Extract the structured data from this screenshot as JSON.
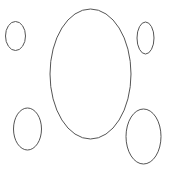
{
  "diagram": {
    "stroke_color": "#555555",
    "background_color": "#ffffff",
    "shapes": [
      {
        "name": "central-ellipse",
        "kind": "ellipse"
      },
      {
        "name": "top-left-ellipse",
        "kind": "ellipse"
      },
      {
        "name": "top-right-ellipse",
        "kind": "ellipse"
      },
      {
        "name": "bottom-left-ellipse",
        "kind": "ellipse"
      },
      {
        "name": "bottom-right-ellipse",
        "kind": "ellipse"
      }
    ]
  }
}
